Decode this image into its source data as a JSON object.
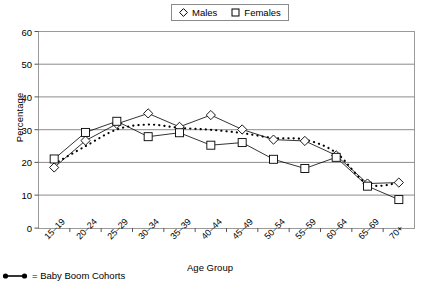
{
  "chart_data": {
    "type": "line",
    "title": "",
    "xlabel": "Age Group",
    "ylabel": "Percentage",
    "ylim": [
      0,
      60
    ],
    "yticks": [
      0,
      10,
      20,
      30,
      40,
      50,
      60
    ],
    "grid": true,
    "legend_position": "top-center",
    "categories": [
      "15–19",
      "20–24",
      "25–29",
      "30–34",
      "35–39",
      "40–44",
      "45–49",
      "50–54",
      "55–59",
      "60–64",
      "65–69",
      "70+"
    ],
    "series": [
      {
        "name": "Males",
        "marker": "diamond",
        "values": [
          18.5,
          26.7,
          31.8,
          35.0,
          30.9,
          34.5,
          30.1,
          27.0,
          26.6,
          22.2,
          13.6,
          13.9
        ]
      },
      {
        "name": "Females",
        "marker": "square",
        "values": [
          21.1,
          29.2,
          32.6,
          27.9,
          29.1,
          25.3,
          26.1,
          21.0,
          18.2,
          21.6,
          12.8,
          8.7
        ]
      }
    ],
    "annotations": [
      {
        "name": "baby-boom-cohort-trend",
        "style": "dotted-thick",
        "description": "Dotted curve tracing the Baby Boom cohorts across the age groups",
        "values": [
          19.6,
          25.0,
          30.1,
          31.6,
          30.6,
          30.0,
          29.0,
          27.5,
          27.0,
          23.0,
          13.5,
          13.8
        ]
      }
    ]
  },
  "legend": {
    "entries": [
      {
        "label": "Males",
        "marker": "diamond-icon"
      },
      {
        "label": "Females",
        "marker": "square-icon"
      }
    ]
  },
  "axes": {
    "y_title": "Percentage",
    "x_title": "Age Group",
    "y_tick_labels": [
      "60",
      "50",
      "40",
      "30",
      "20",
      "10",
      "0"
    ],
    "x_tick_labels": [
      "15–19",
      "20–24",
      "25–29",
      "30–34",
      "35–39",
      "40–44",
      "45–49",
      "50–54",
      "55–59",
      "60–64",
      "65–69",
      "70+"
    ]
  },
  "footnote": {
    "marker": "dotted-line-icon",
    "text": "= Baby Boom Cohorts"
  }
}
